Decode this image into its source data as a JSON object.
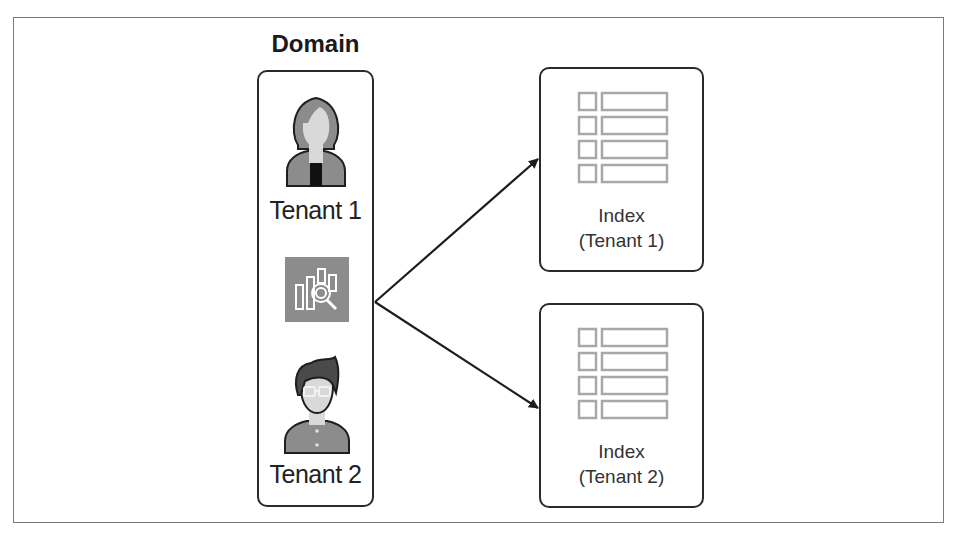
{
  "diagram": {
    "domain": {
      "title": "Domain",
      "tenants": [
        {
          "label": "Tenant 1",
          "icon": "female-user-icon"
        },
        {
          "label": "Tenant 2",
          "icon": "male-user-icon"
        }
      ],
      "service_icon": "search-analytics-service-icon"
    },
    "indexes": [
      {
        "line1": "Index",
        "line2": "(Tenant 1)",
        "icon": "table-index-icon"
      },
      {
        "line1": "Index",
        "line2": "(Tenant 2)",
        "icon": "table-index-icon"
      }
    ],
    "connections": [
      {
        "from": "Domain",
        "to": "Index (Tenant 1)"
      },
      {
        "from": "Domain",
        "to": "Index (Tenant 2)"
      }
    ],
    "colors": {
      "stroke": "#2a2a2a",
      "icon_gray": "#8c8c8c",
      "icon_light": "#d9d9d9",
      "table_gray": "#a8a8a8",
      "frame": "#7a7a7a"
    }
  }
}
